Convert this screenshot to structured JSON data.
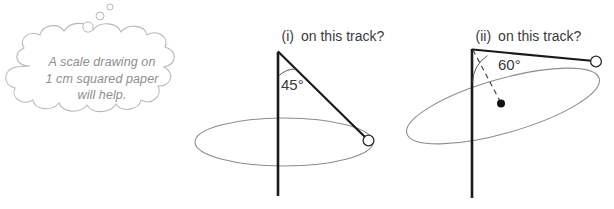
{
  "page": {
    "background_color": "#ffffff",
    "width": 614,
    "height": 209
  },
  "thought_bubble": {
    "name": "thought-bubble",
    "text": "A scale drawing on\n1 cm squared paper\nwill help.",
    "lines": [
      "A scale drawing on",
      "1 cm squared paper",
      "will help."
    ],
    "outline_color": "#b9b9bb",
    "text_color": "#8e8e90",
    "tail_bubbles": 3
  },
  "figures": [
    {
      "id": "fig-i",
      "caption_number": "(i)",
      "caption_text": "on this track?",
      "angle_label": "45°",
      "angle_value": 45,
      "pole_color": "#1a1a1a",
      "string_color": "#1a1a1a",
      "track_color": "#8c8c8e",
      "ball": "open-circle",
      "track_orientation": "horizontal-ellipse"
    },
    {
      "id": "fig-ii",
      "caption_number": "(ii)",
      "caption_text": "on this track?",
      "angle_label": "60°",
      "angle_value": 60,
      "pole_color": "#1a1a1a",
      "string_color": "#1a1a1a",
      "track_color": "#8c8c8e",
      "ball": "open-circle",
      "centre_marker": "filled-dot",
      "radius_line_style": "dashed",
      "track_orientation": "tilted-ellipse"
    }
  ]
}
